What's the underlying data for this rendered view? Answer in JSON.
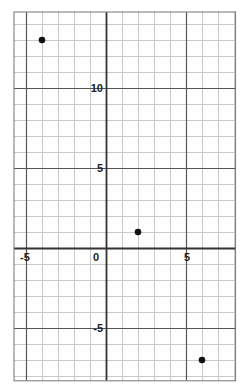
{
  "chart_data": {
    "type": "scatter",
    "title": "",
    "xlabel": "",
    "ylabel": "",
    "xlim": [
      -5.75,
      8.1
    ],
    "ylim": [
      -8.3,
      14.75
    ],
    "grid": true,
    "grid_step": 1,
    "major_step": 5,
    "x_tick_labels": [
      "-5",
      "0",
      "5"
    ],
    "y_tick_labels": [
      "10",
      "5",
      "-5"
    ],
    "points": [
      {
        "x": -4,
        "y": 13
      },
      {
        "x": 2,
        "y": 1
      },
      {
        "x": 6,
        "y": -7
      }
    ],
    "colors": {
      "minor_grid": "#c8c8c8",
      "major_grid": "#555555",
      "axis": "#333333",
      "point": "#111111"
    }
  }
}
